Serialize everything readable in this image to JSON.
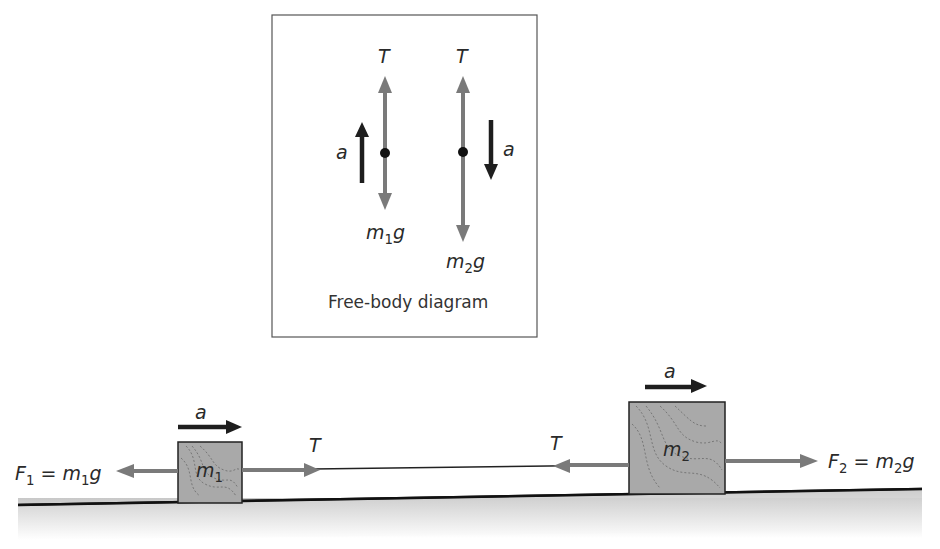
{
  "free_body_diagram": {
    "caption": "Free-body diagram",
    "mass1": {
      "tension_label": "T",
      "weight_label_var": "m",
      "weight_label_sub": "1",
      "weight_label_suffix": "g",
      "accel_label": "a",
      "accel_direction": "up"
    },
    "mass2": {
      "tension_label": "T",
      "weight_label_var": "m",
      "weight_label_sub": "2",
      "weight_label_suffix": "g",
      "accel_label": "a",
      "accel_direction": "down"
    }
  },
  "horizontal_system": {
    "block1": {
      "label_var": "m",
      "label_sub": "1",
      "accel_label": "a",
      "force_label": {
        "F": "F",
        "F_sub": "1",
        "eq": " = ",
        "m": "m",
        "m_sub": "1",
        "g": "g"
      },
      "tension_label": "T"
    },
    "block2": {
      "label_var": "m",
      "label_sub": "2",
      "accel_label": "a",
      "force_label": {
        "F": "F",
        "F_sub": "2",
        "eq": " = ",
        "m": "m",
        "m_sub": "2",
        "g": "g"
      },
      "tension_label": "T"
    }
  },
  "colors": {
    "force_arrow": "#7a7a7a",
    "accel_arrow": "#1e1e1e",
    "block_fill": "#a9a9a9",
    "block_grain": "#6a6a6a",
    "surface_line": "#111111",
    "surface_shade": "#cfcfcf",
    "frame": "#555555"
  }
}
